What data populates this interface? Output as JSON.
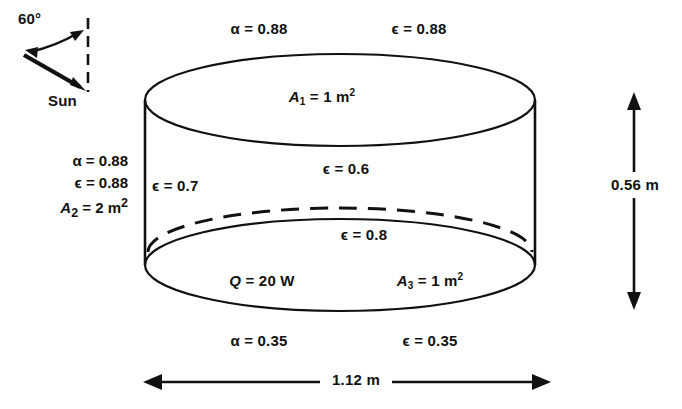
{
  "diagram": {
    "geometry": {
      "cylinder_diameter": "1.12 m",
      "cylinder_height": "0.56 m",
      "sun_angle": "60°"
    },
    "colors": {
      "line": "#111111",
      "background": "#ffffff"
    },
    "sun": {
      "angle_label": "60°",
      "source_label": "Sun"
    },
    "surfaces": {
      "top": {
        "alpha": "α = 0.88",
        "epsilon_outer": "ϵ = 0.88",
        "area_symbol": "A",
        "area_subscript": "1",
        "area_value": " = 1 m",
        "area_exponent": "2",
        "epsilon_inner": "ϵ = 0.6"
      },
      "side": {
        "alpha": "α = 0.88",
        "epsilon_outer": "ϵ = 0.88",
        "area_symbol": "A",
        "area_subscript": "2",
        "area_value": " = 2 m",
        "area_exponent": "2",
        "epsilon_inner": "ϵ = 0.7"
      },
      "bottom": {
        "alpha": "α = 0.35",
        "epsilon_outer": "ϵ = 0.35",
        "area_symbol": "A",
        "area_subscript": "3",
        "area_value": " = 1 m",
        "area_exponent": "2",
        "epsilon_inner": "ϵ = 0.8"
      }
    },
    "heat": {
      "symbol": "Q",
      "value": " = 20 W"
    },
    "dimensions": {
      "height_label": "0.56 m",
      "width_label": "1.12 m"
    }
  }
}
